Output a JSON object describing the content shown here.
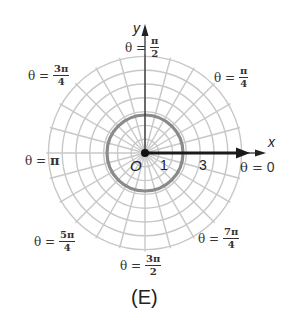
{
  "figure": {
    "caption": "(E)",
    "axes": {
      "x_label": "x",
      "y_label": "y",
      "origin_label": "O"
    },
    "tick_labels": {
      "one": "1",
      "three": "3"
    },
    "angle_labels": {
      "zero": {
        "prefix": "θ =",
        "value": "0"
      },
      "pi_4": {
        "prefix": "θ =",
        "num": "π",
        "den": "4"
      },
      "pi_2": {
        "prefix": "θ =",
        "num": "π",
        "den": "2"
      },
      "3pi_4": {
        "prefix": "θ =",
        "num": "3π",
        "den": "4"
      },
      "pi": {
        "prefix": "θ =",
        "value": "π"
      },
      "5pi_4": {
        "prefix": "θ =",
        "num": "5π",
        "den": "4"
      },
      "3pi_2": {
        "prefix": "θ =",
        "num": "3π",
        "den": "2"
      },
      "7pi_4": {
        "prefix": "θ =",
        "num": "7π",
        "den": "4"
      }
    },
    "colors": {
      "grid": "#c8c8c8",
      "highlight_circle": "#8a8a8a",
      "ray": "#1a1a1a",
      "text": "#333333"
    },
    "grid": {
      "radial_step_deg": 15,
      "circle_count": 7,
      "highlight_circle_r_units": 2,
      "ray": {
        "from_r": 0,
        "to_r": 7,
        "theta": 0
      }
    }
  }
}
